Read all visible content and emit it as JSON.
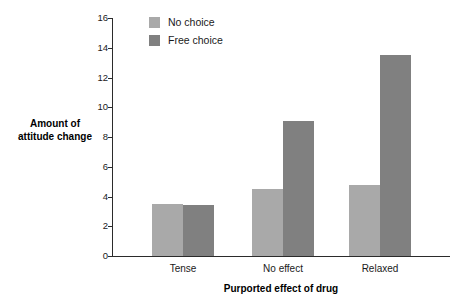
{
  "chart_data": {
    "type": "bar",
    "title": "",
    "xlabel": "Purported effect of drug",
    "ylabel": "Amount of attitude change",
    "ylabel_lines": [
      "Amount of",
      "attitude change"
    ],
    "categories": [
      "Tense",
      "No effect",
      "Relaxed"
    ],
    "series": [
      {
        "name": "No choice",
        "color": "#a9a9a9",
        "values": [
          3.5,
          4.5,
          4.75
        ]
      },
      {
        "name": "Free choice",
        "color": "#808080",
        "values": [
          3.4,
          9.1,
          13.5
        ]
      }
    ],
    "ylim": [
      0,
      16
    ],
    "ytick_step": 2,
    "ytick_labels": [
      "0",
      "2",
      "4",
      "6",
      "8",
      "10",
      "12",
      "14",
      "16"
    ],
    "grid": false,
    "legend_position": "top-left-inside",
    "background": "#ffffff",
    "axis_color": "#2b2b2b"
  }
}
